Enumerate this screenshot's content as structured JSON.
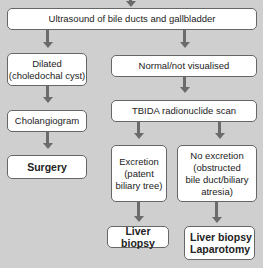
{
  "flowchart": {
    "nodes": {
      "ultrasound": "Ultrasound of bile ducts and gallbladder",
      "dilated_line1": "Dilated",
      "dilated_line2": "(choledochal cyst)",
      "normal": "Normal/not visualised",
      "cholangiogram": "Cholangiogram",
      "tbida": "TBIDA radionuclide scan",
      "surgery": "Surgery",
      "excretion_line1": "Excretion",
      "excretion_line2": "(patent",
      "excretion_line3": "biliary tree)",
      "no_excretion_line1": "No excretion",
      "no_excretion_line2": "(obstructed",
      "no_excretion_line3": "bile duct/biliary",
      "no_excretion_line4": "atresia)",
      "liver_biopsy_left": "Liver biopsy",
      "liver_biopsy_right_line1": "Liver biopsy",
      "liver_biopsy_right_line2": "Laparotomy"
    },
    "edges": [
      [
        "ultrasound",
        "dilated"
      ],
      [
        "ultrasound",
        "normal"
      ],
      [
        "dilated",
        "cholangiogram"
      ],
      [
        "cholangiogram",
        "surgery"
      ],
      [
        "normal",
        "tbida"
      ],
      [
        "tbida",
        "excretion"
      ],
      [
        "tbida",
        "no_excretion"
      ],
      [
        "excretion",
        "liver_biopsy_left"
      ],
      [
        "no_excretion",
        "liver_biopsy_right"
      ]
    ],
    "colors": {
      "background": "#cfcfcf",
      "box_fill": "#ffffff",
      "border": "#666666",
      "arrow": "#6b6b6b"
    }
  }
}
